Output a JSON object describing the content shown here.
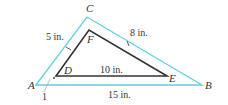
{
  "diagram": {
    "title": "",
    "colors": {
      "outer_triangle": "#5fd0e0",
      "inner_triangle": "#333333",
      "text": "#333333"
    },
    "outer_triangle": {
      "vertices": {
        "A": {
          "label": "A",
          "x": 36,
          "y": 85
        },
        "C": {
          "label": "C",
          "x": 87,
          "y": 17
        },
        "B": {
          "label": "B",
          "x": 202,
          "y": 85
        }
      }
    },
    "inner_triangle": {
      "vertices": {
        "D": {
          "label": "D",
          "x": 56,
          "y": 76
        },
        "F": {
          "label": "F",
          "x": 89,
          "y": 30
        },
        "E": {
          "label": "E",
          "x": 167,
          "y": 76
        }
      }
    },
    "measurements": {
      "side_AC": "5 in.",
      "side_CB": "8 in.",
      "side_DE": "10 in.",
      "side_AB": "15 in.",
      "gap": "1"
    }
  }
}
